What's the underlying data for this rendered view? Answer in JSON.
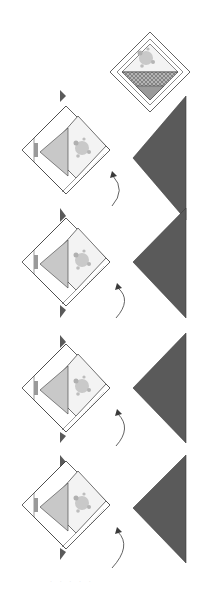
{
  "diagram": {
    "colors": {
      "background": "#ffffff",
      "outline": "#3a3a3a",
      "dark_triangle": "#5a5a5a",
      "light_triangle": "#c8c8c8",
      "print_fabric": "#f1f1f1",
      "print_motif": "#9a9a9a",
      "basket_check": "#8c8c8c",
      "strip": "#ffffff"
    },
    "top_block": {
      "label": "basket-block",
      "center_x": 150,
      "center_y": 55
    },
    "steps": [
      {
        "step": 1,
        "unit_center_y": 155,
        "triangle_top": 95,
        "triangle_bottom": 220
      },
      {
        "step": 2,
        "unit_center_y": 262,
        "triangle_top": 208,
        "triangle_bottom": 318
      },
      {
        "step": 3,
        "unit_center_y": 388,
        "triangle_top": 333,
        "triangle_bottom": 443
      },
      {
        "step": 4,
        "unit_center_y": 505,
        "triangle_top": 455,
        "triangle_bottom": 563
      }
    ],
    "caption": "· · · · ·"
  }
}
